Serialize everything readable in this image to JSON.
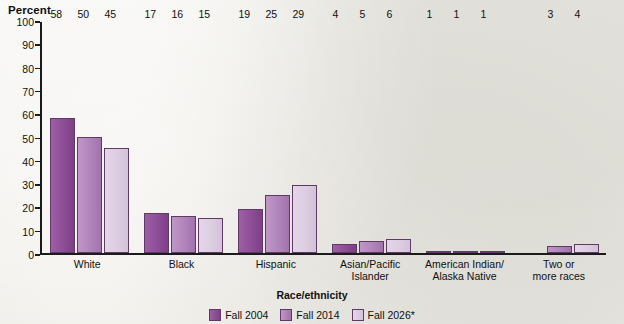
{
  "chart_data": {
    "type": "bar",
    "title": "",
    "ylabel": "Percent",
    "xlabel": "Race/ethnicity",
    "ylim": [
      0,
      100
    ],
    "yticks": [
      100,
      90,
      80,
      70,
      60,
      50,
      40,
      30,
      20,
      10,
      0
    ],
    "grid": false,
    "legend_position": "bottom",
    "categories": [
      "White",
      "Black",
      "Hispanic",
      "Asian/Pacific\nIslander",
      "American Indian/\nAlaska Native",
      "Two or\nmore races"
    ],
    "category_lines": [
      [
        "White"
      ],
      [
        "Black"
      ],
      [
        "Hispanic"
      ],
      [
        "Asian/Pacific",
        "Islander"
      ],
      [
        "American Indian/",
        "Alaska Native"
      ],
      [
        "Two or",
        "more races"
      ]
    ],
    "series": [
      {
        "name": "Fall 2004",
        "color": "#8e4d97",
        "values": [
          58,
          17,
          19,
          4,
          1,
          null
        ],
        "labels": [
          "58",
          "17",
          "19",
          "4",
          "1",
          ""
        ]
      },
      {
        "name": "Fall 2014",
        "color": "#b084ba",
        "values": [
          50,
          16,
          25,
          5,
          1,
          3
        ],
        "labels": [
          "50",
          "16",
          "25",
          "5",
          "1",
          "3"
        ]
      },
      {
        "name": "Fall 2026*",
        "color": "#dccde1",
        "values": [
          45,
          15,
          29,
          6,
          1,
          4
        ],
        "labels": [
          "45",
          "15",
          "29",
          "6",
          "1",
          "4"
        ]
      }
    ]
  }
}
